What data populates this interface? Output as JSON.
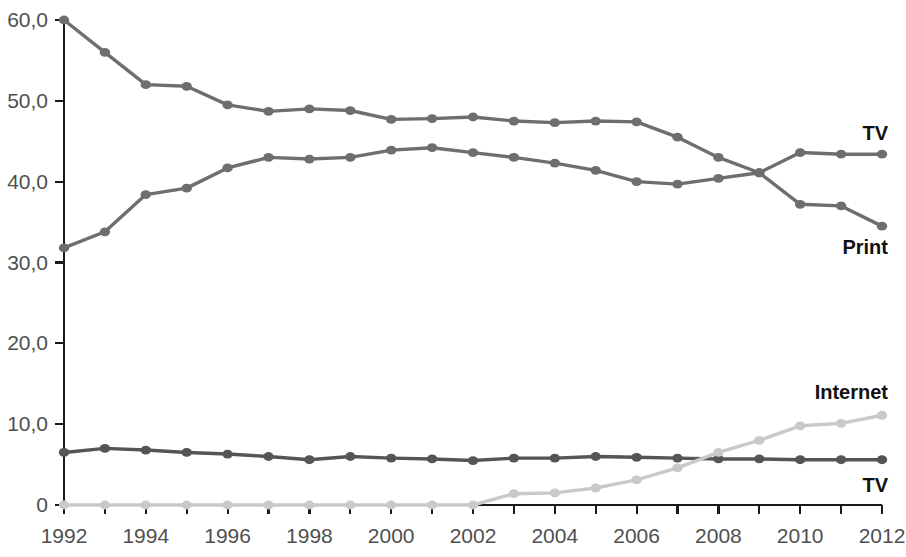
{
  "chart_data": {
    "type": "line",
    "title": "",
    "subtitle": "",
    "xlabel": "",
    "ylabel": "",
    "xlim": [
      1992,
      2012
    ],
    "ylim": [
      0,
      60
    ],
    "grid": false,
    "legend_position": "inline-right-end-of-line",
    "x": [
      1992,
      1993,
      1994,
      1995,
      1996,
      1997,
      1998,
      1999,
      2000,
      2001,
      2002,
      2003,
      2004,
      2005,
      2006,
      2007,
      2008,
      2009,
      2010,
      2011,
      2012
    ],
    "y_ticks": [
      0,
      10,
      20,
      30,
      40,
      50,
      60
    ],
    "y_tick_labels": [
      "0",
      "10,0",
      "20,0",
      "30,0",
      "40,0",
      "50,0",
      "60,0"
    ],
    "x_ticks": [
      1992,
      1993,
      1994,
      1995,
      1996,
      1997,
      1998,
      1999,
      2000,
      2001,
      2002,
      2003,
      2004,
      2005,
      2006,
      2007,
      2008,
      2009,
      2010,
      2011,
      2012
    ],
    "x_tick_labels": [
      "1992",
      "",
      "1994",
      "",
      "1996",
      "",
      "1998",
      "",
      "2000",
      "",
      "2002",
      "",
      "2004",
      "",
      "2006",
      "",
      "2008",
      "",
      "2010",
      "",
      "2012"
    ],
    "x_major_labels": [
      "1992",
      "1994",
      "1996",
      "1998",
      "2000",
      "2002",
      "2004",
      "2006",
      "2008",
      "2010",
      "2012"
    ],
    "series": [
      {
        "name": "Print",
        "label": "Print",
        "color": "#6e6e6e",
        "label_anchor": "end",
        "values": [
          60.0,
          56.0,
          52.0,
          51.8,
          49.5,
          48.7,
          49.0,
          48.8,
          47.7,
          47.8,
          48.0,
          47.5,
          47.3,
          47.5,
          47.4,
          45.5,
          43.0,
          41.1,
          37.2,
          37.0,
          34.5
        ]
      },
      {
        "name": "TV",
        "label": "TV",
        "color": "#6e6e6e",
        "label_anchor": "end",
        "values": [
          31.8,
          33.8,
          38.4,
          39.2,
          41.7,
          43.0,
          42.8,
          43.0,
          43.9,
          44.2,
          43.6,
          43.0,
          42.3,
          41.4,
          40.0,
          39.7,
          40.4,
          41.1,
          43.6,
          43.4,
          43.4
        ]
      },
      {
        "name": "TV (second)",
        "label": "TV",
        "color": "#555555",
        "label_anchor": "end",
        "values": [
          6.5,
          7.0,
          6.8,
          6.5,
          6.3,
          6.0,
          5.6,
          6.0,
          5.8,
          5.7,
          5.5,
          5.8,
          5.8,
          6.0,
          5.9,
          5.8,
          5.7,
          5.7,
          5.6,
          5.6,
          5.6
        ]
      },
      {
        "name": "Internet",
        "label": "Internet",
        "color": "#c9c9c9",
        "label_anchor": "end",
        "values": [
          0.0,
          0.0,
          0.0,
          0.0,
          0.0,
          0.0,
          0.0,
          0.0,
          0.0,
          0.0,
          0.0,
          1.4,
          1.5,
          2.1,
          3.1,
          4.6,
          6.5,
          8.0,
          9.8,
          10.1,
          11.1
        ]
      }
    ],
    "annotations": [
      {
        "text": "TV",
        "series": "TV",
        "position": "upper-right"
      },
      {
        "text": "Print",
        "series": "Print",
        "position": "right-below"
      },
      {
        "text": "Internet",
        "series": "Internet",
        "position": "lower-right-above"
      },
      {
        "text": "TV",
        "series": "TV (second)",
        "position": "lower-right-below"
      }
    ]
  }
}
